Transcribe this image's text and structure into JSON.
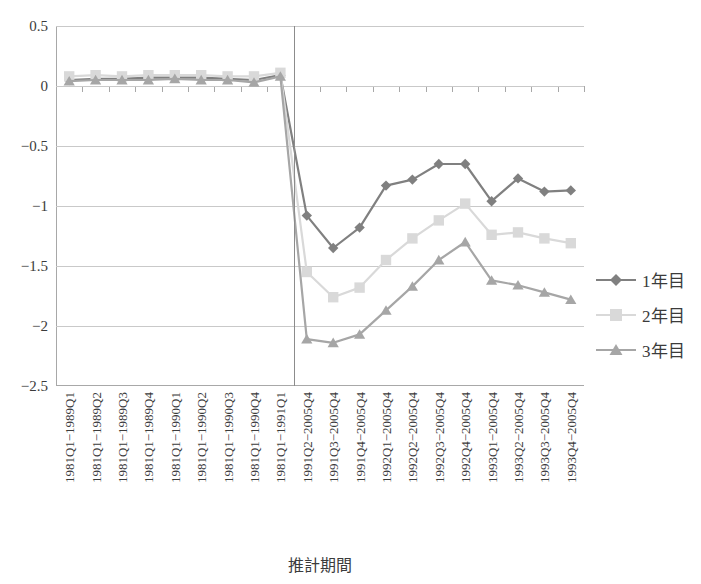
{
  "chart_data": {
    "type": "line",
    "title": "",
    "xlabel": "推計期間",
    "ylabel": "",
    "ylim": [
      -2.5,
      0.5
    ],
    "ytick_step": 0.5,
    "yticks": [
      "0.5",
      "0",
      "-0.5",
      "-1",
      "-1.5",
      "-2",
      "-2.5"
    ],
    "ytick_values": [
      0.5,
      0,
      -0.5,
      -1,
      -1.5,
      -2,
      -2.5
    ],
    "grid": true,
    "legend_position": "right",
    "divider_after_category_index": 8,
    "categories": [
      "1981Q1−1989Q1",
      "1981Q1−1989Q2",
      "1981Q1−1989Q3",
      "1981Q1−1989Q4",
      "1981Q1−1990Q1",
      "1981Q1−1990Q2",
      "1981Q1−1990Q3",
      "1981Q1−1990Q4",
      "1981Q1−1991Q1",
      "1991Q2−2005Q4",
      "1991Q3−2005Q4",
      "1991Q4−2005Q4",
      "1992Q1−2005Q4",
      "1992Q2−2005Q4",
      "1992Q3−2005Q4",
      "1992Q4−2005Q4",
      "1993Q1−2005Q4",
      "1993Q2−2005Q4",
      "1993Q3−2005Q4",
      "1993Q4−2005Q4"
    ],
    "series": [
      {
        "name": "1年目",
        "color": "#808080",
        "marker": "diamond",
        "values": [
          0.05,
          0.06,
          0.06,
          0.07,
          0.07,
          0.07,
          0.06,
          0.05,
          0.09,
          -1.08,
          -1.35,
          -1.18,
          -0.83,
          -0.78,
          -0.65,
          -0.65,
          -0.96,
          -0.77,
          -0.88,
          -0.87
        ]
      },
      {
        "name": "2年目",
        "color": "#d9d9d9",
        "marker": "square",
        "values": [
          0.08,
          0.09,
          0.08,
          0.09,
          0.09,
          0.09,
          0.08,
          0.08,
          0.11,
          -1.55,
          -1.76,
          -1.68,
          -1.45,
          -1.27,
          -1.12,
          -0.98,
          -1.24,
          -1.22,
          -1.27,
          -1.31
        ]
      },
      {
        "name": "3年目",
        "color": "#a6a6a6",
        "marker": "triangle",
        "values": [
          0.04,
          0.05,
          0.05,
          0.05,
          0.06,
          0.05,
          0.05,
          0.03,
          0.08,
          -2.11,
          -2.14,
          -2.07,
          -1.87,
          -1.67,
          -1.45,
          -1.3,
          -1.62,
          -1.66,
          -1.72,
          -1.78
        ]
      }
    ]
  }
}
